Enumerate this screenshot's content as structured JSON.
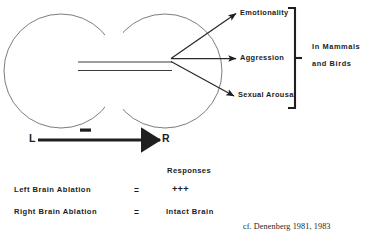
{
  "figure": {
    "citation": "cf. Denenberg 1981, 1983"
  },
  "brain": {
    "left_hemisphere_name": "left-hemisphere",
    "right_hemisphere_name": "right-hemisphere",
    "corpus_callosum_name": "corpus-callosum"
  },
  "outputs": {
    "items": [
      {
        "label": "Emotionality"
      },
      {
        "label": "Aggression"
      },
      {
        "label": "Sexual Arousal"
      }
    ],
    "group_line1": "In  Mammals",
    "group_line2": "and  Birds"
  },
  "axis": {
    "left_label": "L",
    "right_label": "R",
    "sign": "−"
  },
  "table": {
    "header": "Responses",
    "rows": [
      {
        "condition": "Left  Brain  Ablation",
        "operator": "=",
        "result": "+++"
      },
      {
        "condition": "Right  Brain  Ablation",
        "operator": "=",
        "result": "Intact  Brain"
      }
    ]
  },
  "colors": {
    "ink": "#1c1c1c",
    "outline": "#555555",
    "background": "#ffffff"
  }
}
